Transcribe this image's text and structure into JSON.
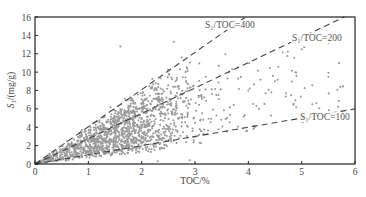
{
  "chart_data": {
    "type": "scatter",
    "title": "",
    "xlabel": "TOC/%",
    "ylabel": "S1/(mg/g)",
    "xlim": [
      0,
      6
    ],
    "ylim": [
      0,
      16
    ],
    "x_ticks": [
      0,
      1,
      2,
      3,
      4,
      5,
      6
    ],
    "y_ticks": [
      0,
      2,
      4,
      6,
      8,
      10,
      12,
      14,
      16
    ],
    "grid": false,
    "legend": null,
    "point_color": "#9a9a9a",
    "reference_lines": [
      {
        "name": "S1/TOC=400",
        "label": "S₁/TOC=400",
        "slope": 4.0,
        "x_end": 3.95,
        "y_end": 16,
        "style": "dashed"
      },
      {
        "name": "S1/TOC=200",
        "label": "S₁/TOC=200",
        "slope": 2.75,
        "x_end": 5.8,
        "y_end": 16,
        "style": "dashed"
      },
      {
        "name": "S1/TOC=100",
        "label": "S₁/TOC=100",
        "slope": 1.0,
        "x_end": 6.0,
        "y_end": 6.0,
        "style": "dashed"
      }
    ],
    "scatter_description": "Dense cloud of ~1500 samples between S1/TOC≈60 and ≈400, concentrated at TOC 0.3–3.2%, S1 0.5–8 mg/g; sparse outliers to TOC≈5.8% and S1≈13 mg/g.",
    "sample_points": [
      {
        "x": 0.3,
        "y": 0.5
      },
      {
        "x": 0.6,
        "y": 1.2
      },
      {
        "x": 0.9,
        "y": 1.8
      },
      {
        "x": 1.0,
        "y": 2.5
      },
      {
        "x": 1.2,
        "y": 3.0
      },
      {
        "x": 1.4,
        "y": 2.2
      },
      {
        "x": 1.5,
        "y": 4.0
      },
      {
        "x": 1.7,
        "y": 3.5
      },
      {
        "x": 1.8,
        "y": 5.0
      },
      {
        "x": 2.0,
        "y": 4.2
      },
      {
        "x": 2.1,
        "y": 6.0
      },
      {
        "x": 2.2,
        "y": 3.0
      },
      {
        "x": 2.4,
        "y": 7.0
      },
      {
        "x": 2.5,
        "y": 5.5
      },
      {
        "x": 2.7,
        "y": 8.2
      },
      {
        "x": 2.9,
        "y": 6.5
      },
      {
        "x": 3.0,
        "y": 4.5
      },
      {
        "x": 3.2,
        "y": 9.5
      },
      {
        "x": 3.4,
        "y": 7.5
      },
      {
        "x": 3.6,
        "y": 5.0
      },
      {
        "x": 3.8,
        "y": 10.5
      },
      {
        "x": 4.0,
        "y": 8.0
      },
      {
        "x": 4.2,
        "y": 6.0
      },
      {
        "x": 4.5,
        "y": 9.0
      },
      {
        "x": 4.8,
        "y": 7.5
      },
      {
        "x": 5.0,
        "y": 12.5
      },
      {
        "x": 5.2,
        "y": 6.5
      },
      {
        "x": 5.5,
        "y": 9.5
      },
      {
        "x": 5.7,
        "y": 11.0
      },
      {
        "x": 1.6,
        "y": 12.8
      },
      {
        "x": 2.6,
        "y": 13.3
      },
      {
        "x": 2.3,
        "y": 0.3
      },
      {
        "x": 2.9,
        "y": 0.4
      }
    ]
  }
}
